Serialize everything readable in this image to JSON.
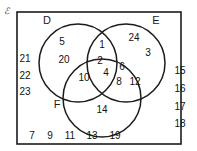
{
  "diagram": {
    "type": "venn-3-set",
    "universe_symbol": "ℰ",
    "universe_symbol_name": "universal-set-symbol",
    "border_color": "#1c1c1c",
    "text_color": "#111111",
    "background_color": "#ffffff",
    "sets": [
      {
        "id": "D",
        "label": "D",
        "label_x": 47,
        "label_y": 24,
        "cx": 78,
        "cy": 63,
        "r": 39
      },
      {
        "id": "E",
        "label": "E",
        "label_x": 156,
        "label_y": 24,
        "cx": 126,
        "cy": 63,
        "r": 39
      },
      {
        "id": "F",
        "label": "F",
        "label_x": 57,
        "label_y": 108,
        "cx": 102,
        "cy": 98,
        "r": 39
      }
    ],
    "regions": [
      {
        "region": "D-only",
        "elements": [
          {
            "value": "5",
            "x": 62,
            "y": 45
          },
          {
            "value": "20",
            "x": 64,
            "y": 63
          }
        ]
      },
      {
        "region": "E-only",
        "elements": [
          {
            "value": "24",
            "x": 134,
            "y": 41
          },
          {
            "value": "3",
            "x": 148,
            "y": 56
          }
        ]
      },
      {
        "region": "F-only",
        "elements": [
          {
            "value": "14",
            "x": 102,
            "y": 113
          }
        ]
      },
      {
        "region": "D-and-E",
        "elements": [
          {
            "value": "1",
            "x": 102,
            "y": 48
          }
        ]
      },
      {
        "region": "D-and-F",
        "elements": [
          {
            "value": "10",
            "x": 84,
            "y": 81
          }
        ]
      },
      {
        "region": "E-and-F",
        "elements": [
          {
            "value": "6",
            "x": 122,
            "y": 70
          },
          {
            "value": "8",
            "x": 119,
            "y": 85
          },
          {
            "value": "12",
            "x": 135,
            "y": 85
          }
        ]
      },
      {
        "region": "D-and-E-and-F",
        "elements": [
          {
            "value": "2",
            "x": 100,
            "y": 64
          },
          {
            "value": "4",
            "x": 106,
            "y": 76
          }
        ]
      }
    ],
    "outside_left": {
      "name": "outside-elements-left",
      "elements": [
        {
          "value": "21",
          "x": 25,
          "y": 62
        },
        {
          "value": "22",
          "x": 25,
          "y": 79
        },
        {
          "value": "23",
          "x": 25,
          "y": 95
        }
      ]
    },
    "outside_right": {
      "name": "outside-elements-right",
      "elements": [
        {
          "value": "15",
          "x": 180,
          "y": 74
        },
        {
          "value": "16",
          "x": 180,
          "y": 92
        },
        {
          "value": "17",
          "x": 180,
          "y": 110
        },
        {
          "value": "18",
          "x": 180,
          "y": 127
        }
      ]
    },
    "outside_bottom": {
      "name": "outside-elements-bottom",
      "elements": [
        {
          "value": "7",
          "x": 32,
          "y": 139
        },
        {
          "value": "9",
          "x": 50,
          "y": 139
        },
        {
          "value": "11",
          "x": 70,
          "y": 139
        },
        {
          "value": "13",
          "x": 92,
          "y": 139
        },
        {
          "value": "19",
          "x": 115,
          "y": 139
        }
      ]
    },
    "universe_box": {
      "x": 17,
      "y": 12,
      "width": 164,
      "height": 132
    },
    "universe_symbol_pos": {
      "x": 4,
      "y": 14
    }
  }
}
